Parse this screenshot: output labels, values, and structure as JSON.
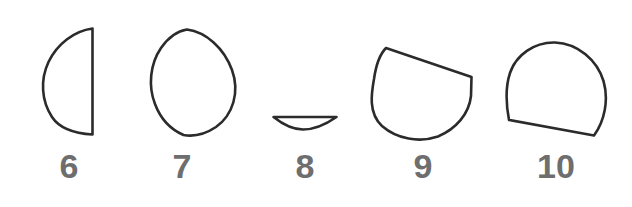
{
  "figure": {
    "background_color": "#ffffff",
    "stroke_color": "#2b2b2b",
    "label_color": "#6e6e6e",
    "stroke_width": 2.6,
    "width": 632,
    "height": 207,
    "shapes": [
      {
        "label": "6",
        "name": "half-disk-flat-right",
        "description": "Half circle with the flat chord on the right side, semicircular arc bulging left",
        "bbox": {
          "x": 43,
          "y": 27,
          "width": 51,
          "height": 109
        },
        "label_position": {
          "x": 46,
          "y": 149,
          "width": 46
        },
        "path": "M 92.5 28.5 C 74 31 57 44 48.5 62 C 40 80 41.5 101 52 117 C 60.5 130 76 133.5 92.5 134.5 L 92.5 28.5 Z"
      },
      {
        "label": "7",
        "name": "lens-vesica-vertical",
        "description": "Vertical lens or vesica shape, pointed at top and bottom, widest at the middle",
        "bbox": {
          "x": 151,
          "y": 28,
          "width": 85,
          "height": 108
        },
        "label_position": {
          "x": 159,
          "y": 149,
          "width": 46
        },
        "path": "M 187 29.5 C 206 32 224 48 232 70 C 240 92 233 115 216 127 C 204 135 192 136.5 183.5 135 C 172 130 161 120 155 104 C 148 86 150 64 161 48 C 168 38 177 31 187 29.5 Z"
      },
      {
        "label": "8",
        "name": "thin-lens-sliver",
        "description": "Very flat lens sliver, a shallow crescent with a nearly straight top edge and a shallow curved bottom",
        "bbox": {
          "x": 272,
          "y": 115,
          "width": 66,
          "height": 15
        },
        "label_position": {
          "x": 282,
          "y": 149,
          "width": 46
        },
        "path": "M 273.5 117 L 336.5 117 C 325 125 312 129.5 303 129.5 C 293 129.5 283 124.5 273.5 117 Z"
      },
      {
        "label": "9",
        "name": "circle-cut-by-slanted-chord-top",
        "description": "Circle truncated by a straight chord running from the upper left down to the right side",
        "bbox": {
          "x": 371,
          "y": 46,
          "width": 103,
          "height": 95
        },
        "label_position": {
          "x": 400,
          "y": 149,
          "width": 46
        },
        "path": "M 386 48 L 471.5 77 L 471 96 C 469 114 456 129 438 136.5 C 419 143 397 139 382 126 C 368 113 371.5 93 374 79 C 376 65 379 55 386 48 Z"
      },
      {
        "label": "10",
        "name": "circle-cut-by-slanted-chord-bottom",
        "description": "Circle truncated by a straight chord along the bottom, slanting slightly downward to the right",
        "bbox": {
          "x": 505,
          "y": 41,
          "width": 101,
          "height": 97
        },
        "label_position": {
          "x": 528,
          "y": 149,
          "width": 56
        },
        "path": "M 555 42.5 C 578 43.5 597 60 603.5 81 C 609 100 604.5 121 594 135.5 L 509 120 C 506 104 505 88 510 73 C 516 55 534 42 555 42.5 Z"
      }
    ]
  }
}
